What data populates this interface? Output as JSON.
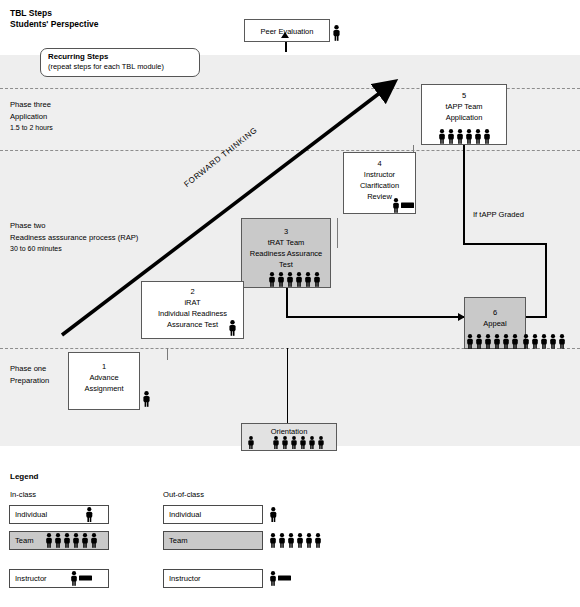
{
  "header": {
    "title_line1": "TBL Steps",
    "title_line2": "Students' Perspective"
  },
  "callout": {
    "heading": "Recurring Steps",
    "subtext": "(repeat steps for each TBL module)"
  },
  "phases": [
    {
      "name": "Phase three",
      "detail": "Application",
      "duration": "1.5 to 2 hours"
    },
    {
      "name": "Phase two",
      "detail": "Readiness asssurance process (RAP)",
      "duration": "30 to 60 minutes"
    },
    {
      "name": "Phase one",
      "detail": "Preparation",
      "duration": ""
    }
  ],
  "steps": [
    {
      "num": "1",
      "line1": "Advance",
      "line2": "Assignment",
      "line3": "",
      "actors": "individual",
      "shade": "white"
    },
    {
      "num": "2",
      "line1": "iRAT",
      "line2": "Individual Readiness",
      "line3": "Assurance Test",
      "actors": "individual",
      "shade": "white"
    },
    {
      "num": "3",
      "line1": "tRAT Team",
      "line2": "Readiness Assurance",
      "line3": "Test",
      "actors": "team",
      "shade": "gray"
    },
    {
      "num": "4",
      "line1": "Instructor",
      "line2": "Clarification",
      "line3": "Review",
      "actors": "instructor",
      "shade": "white"
    },
    {
      "num": "5",
      "line1": "tAPP Team",
      "line2": "Application",
      "line3": "",
      "actors": "team",
      "shade": "white"
    },
    {
      "num": "6",
      "line1": "Appeal",
      "line2": "",
      "line3": "",
      "actors": "team",
      "shade": "gray"
    }
  ],
  "extras": {
    "peer_evaluation": "Peer Evaluation",
    "orientation": "Orientation",
    "if_tapp_graded": "If tAPP Graded",
    "forward_thinking": "FORWARD THINKING"
  },
  "legend": {
    "title": "Legend",
    "col_in_class": "In-class",
    "col_out_of_class": "Out-of-class",
    "rows": [
      {
        "label": "Individual",
        "shade": "white"
      },
      {
        "label": "Team",
        "shade": "gray"
      },
      {
        "label": "Instructor",
        "shade": "white"
      }
    ]
  },
  "icons": {
    "person": "person-icon",
    "team": "team-people-icon",
    "instructor": "instructor-person-board-icon",
    "arrow_up": "arrow-up-icon",
    "arrow_right": "arrow-right-icon"
  },
  "colors": {
    "band_light": "#efefef",
    "band_mid": "#eeeeee",
    "box_gray": "#c9c9c9",
    "line": "#000000",
    "dash": "#8d8d8d"
  },
  "caption": ""
}
